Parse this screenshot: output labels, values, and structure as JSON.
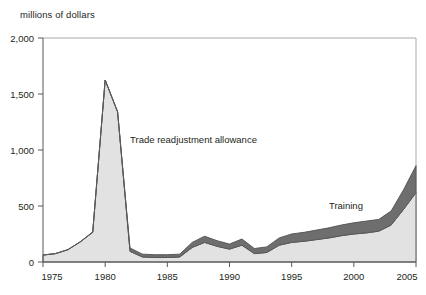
{
  "chart": {
    "axis_title": "millions of dollars",
    "series_labels": {
      "tra": "Trade readjustment allowance",
      "training": "Training"
    },
    "colors": {
      "tra_fill": "#e2e2e2",
      "training_fill": "#6e6e6e",
      "outline": "#58595b",
      "frame": "#a7a9ac",
      "text": "#231f20"
    }
  },
  "chart_data": {
    "type": "area",
    "title": "",
    "subtitle": "",
    "xlabel": "",
    "ylabel": "millions of dollars",
    "xlim": [
      1975,
      2005
    ],
    "ylim": [
      0,
      2000
    ],
    "grid": false,
    "legend": "inline-annotations",
    "stacked": true,
    "xticks": [
      1975,
      1980,
      1985,
      1990,
      1995,
      2000,
      2005
    ],
    "xtick_labels": [
      "1975",
      "1980",
      "1985",
      "1990",
      "1995",
      "2000",
      "2005"
    ],
    "yticks": [
      0,
      500,
      1000,
      1500,
      2000
    ],
    "ytick_labels": [
      "0",
      "500",
      "1,000",
      "1,500",
      "2,000"
    ],
    "x": [
      1975,
      1976,
      1977,
      1978,
      1979,
      1980,
      1981,
      1982,
      1983,
      1984,
      1985,
      1986,
      1987,
      1988,
      1989,
      1990,
      1991,
      1992,
      1993,
      1994,
      1995,
      1996,
      1997,
      1998,
      1999,
      2000,
      2001,
      2002,
      2003,
      2004,
      2005
    ],
    "series": [
      {
        "name": "Trade readjustment allowance",
        "values": [
          62,
          75,
          110,
          180,
          265,
          1625,
          1340,
          95,
          45,
          40,
          40,
          45,
          130,
          175,
          140,
          115,
          150,
          75,
          85,
          150,
          175,
          185,
          200,
          215,
          235,
          250,
          260,
          275,
          330,
          470,
          620
        ]
      },
      {
        "name": "Training",
        "values": [
          0,
          0,
          0,
          0,
          5,
          0,
          0,
          30,
          25,
          25,
          25,
          25,
          45,
          55,
          50,
          45,
          55,
          45,
          50,
          65,
          75,
          80,
          85,
          90,
          95,
          100,
          105,
          105,
          125,
          175,
          240
        ]
      }
    ],
    "annotations": [
      {
        "text": "Trade readjustment allowance",
        "x": 1982.0,
        "y": 1060
      },
      {
        "text": "Training",
        "x": 1998.0,
        "y": 470
      }
    ]
  }
}
